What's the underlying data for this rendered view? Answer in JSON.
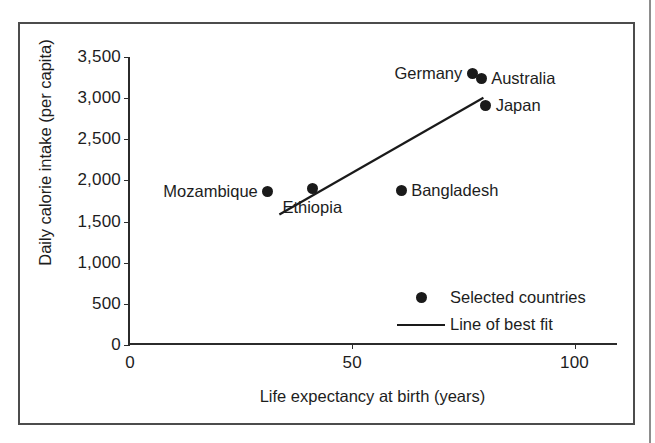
{
  "chart_data": {
    "type": "scatter",
    "title": "",
    "xlabel": "Life expectancy at birth (years)",
    "ylabel": "Daily calorie intake (per capita)",
    "xlim": [
      0,
      110
    ],
    "ylim": [
      0,
      3500
    ],
    "grid": false,
    "xticks": [
      {
        "value": 0,
        "label": "0"
      },
      {
        "value": 50,
        "label": "50"
      },
      {
        "value": 100,
        "label": "100"
      }
    ],
    "yticks": [
      {
        "value": 0,
        "label": "0"
      },
      {
        "value": 500,
        "label": "500"
      },
      {
        "value": 1000,
        "label": "1,000"
      },
      {
        "value": 1500,
        "label": "1,500"
      },
      {
        "value": 2000,
        "label": "2,000"
      },
      {
        "value": 2500,
        "label": "2,500"
      },
      {
        "value": 3000,
        "label": "3,000"
      },
      {
        "value": 3500,
        "label": "3,500"
      }
    ],
    "points": [
      {
        "name": "Mozambique",
        "x": 31,
        "y": 1870,
        "label_side": "left"
      },
      {
        "name": "Ethiopia",
        "x": 41,
        "y": 1905,
        "label_side": "below"
      },
      {
        "name": "Bangladesh",
        "x": 61,
        "y": 1880,
        "label_side": "right"
      },
      {
        "name": "Germany",
        "x": 77,
        "y": 3300,
        "label_side": "left"
      },
      {
        "name": "Australia",
        "x": 79,
        "y": 3240,
        "label_side": "right"
      },
      {
        "name": "Japan",
        "x": 80,
        "y": 2915,
        "label_side": "right"
      }
    ],
    "best_fit_line": {
      "x0": 33.6,
      "y0": 1585,
      "x1": 79.5,
      "y1": 3005
    },
    "legend": {
      "position": "inside-lower-right",
      "entries": [
        {
          "marker": "dot",
          "label": "Selected countries"
        },
        {
          "marker": "line",
          "label": "Line of best fit"
        }
      ]
    },
    "colors": {
      "marker": "#1a1a1a",
      "line": "#1a1a1a",
      "axis": "#2b2b2b",
      "text": "#1d1d1d"
    }
  }
}
